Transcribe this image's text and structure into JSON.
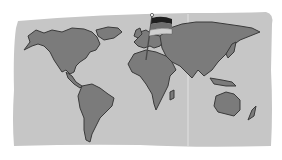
{
  "illustration": {
    "subject": "World map with flag planted in Europe",
    "style": "grayscale clipart",
    "colors": {
      "background": "#ffffff",
      "paper": "#c6c6c6",
      "land": "#7b7b7b",
      "outline": "#3a3a3a",
      "fold_line": "#e2e2e2",
      "flag_top": "#1e1e1e",
      "flag_middle": "#6e6e6e",
      "flag_bottom": "#cfcfcf",
      "pole": "#4a4a4a"
    },
    "elements": {
      "map": "world-map",
      "flag": "flag-germany",
      "flag_location": "Europe"
    }
  }
}
